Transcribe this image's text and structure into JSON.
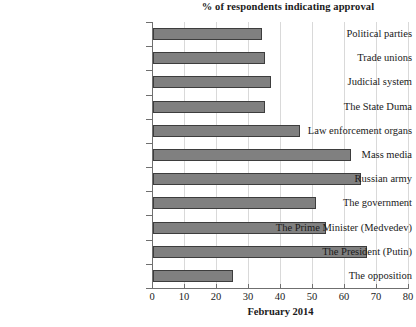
{
  "chart_data": {
    "type": "bar",
    "orientation": "horizontal",
    "title": "% of respondents indicating approval",
    "xlabel": "February 2014",
    "ylabel": "",
    "xlim": [
      0,
      80
    ],
    "xticks": [
      0,
      10,
      20,
      30,
      40,
      50,
      60,
      70,
      80
    ],
    "grid": true,
    "legend": false,
    "bar_color": "#808080",
    "bar_edge_color": "#3d3d3d",
    "axis_color": "#6f6f6f",
    "grid_color": "#d9d9d9",
    "categories": [
      "Political parties",
      "Trade unions",
      "Judicial system",
      "The State Duma",
      "Law enforcement organs",
      "Mass media",
      "Russian army",
      "The government",
      "The Prime Minister (Medvedev)",
      "The President (Putin)",
      "The opposition"
    ],
    "values": [
      34,
      35,
      37,
      35,
      46,
      62,
      65,
      51,
      54,
      67,
      25
    ]
  }
}
